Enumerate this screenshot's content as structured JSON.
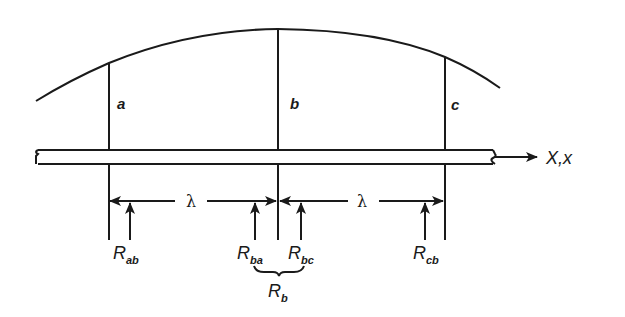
{
  "diagram": {
    "type": "beam-on-elastic-foundation-segments",
    "colors": {
      "stroke": "#1a1a1a",
      "background": "#ffffff"
    },
    "points": [
      {
        "id": "a",
        "label": "a"
      },
      {
        "id": "b",
        "label": "b"
      },
      {
        "id": "c",
        "label": "c"
      }
    ],
    "axis_label": "X,x",
    "spacing_label": "λ",
    "reactions": [
      {
        "id": "ab",
        "main": "R",
        "sub": "ab"
      },
      {
        "id": "ba",
        "main": "R",
        "sub": "ba"
      },
      {
        "id": "bc",
        "main": "R",
        "sub": "bc"
      },
      {
        "id": "cb",
        "main": "R",
        "sub": "cb"
      }
    ],
    "combined_reaction": {
      "main": "R",
      "sub": "b"
    }
  }
}
